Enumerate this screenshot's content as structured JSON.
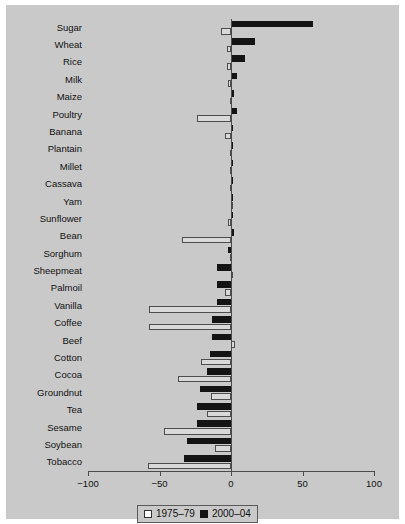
{
  "chart_data": {
    "type": "bar",
    "orientation": "horizontal",
    "title": "",
    "xlabel": "",
    "ylabel": "",
    "xlim": [
      -100,
      100
    ],
    "xticks": [
      -100,
      -50,
      0,
      50,
      100
    ],
    "xticklabels": [
      "−100",
      "−50",
      "0",
      "50",
      "100"
    ],
    "grid": false,
    "legend_position": "bottom-center",
    "categories": [
      "Sugar",
      "Wheat",
      "Rice",
      "Milk",
      "Maize",
      "Poultry",
      "Banana",
      "Plantain",
      "Millet",
      "Cassava",
      "Yam",
      "Sunflower",
      "Bean",
      "Sorghum",
      "Sheepmeat",
      "Palmoil",
      "Vanilla",
      "Coffee",
      "Beef",
      "Cotton",
      "Cocoa",
      "Groundnut",
      "Tea",
      "Sesame",
      "Soybean",
      "Tobacco"
    ],
    "series": [
      {
        "name": "1975–79",
        "color": "#d9d9d9",
        "values": [
          -7,
          -3,
          -3,
          -2,
          -1,
          -24,
          -4,
          -1,
          -1,
          -1,
          0,
          -2,
          -34,
          -1,
          1,
          -4,
          -57,
          -57,
          3,
          -21,
          -37,
          -14,
          -17,
          -47,
          -11,
          -58
        ]
      },
      {
        "name": "2000–04",
        "color": "#141414",
        "values": [
          57,
          17,
          10,
          4,
          2,
          4,
          1,
          0,
          0,
          0,
          0,
          1,
          2,
          -2,
          -10,
          -10,
          -10,
          -13,
          -13,
          -15,
          -17,
          -22,
          -24,
          -24,
          -31,
          -33
        ]
      }
    ]
  },
  "legend": {
    "items": [
      {
        "label": "1975–79",
        "swatch": "white-square-icon"
      },
      {
        "label": "2000–04",
        "swatch": "black-square-icon"
      }
    ]
  },
  "colors": {
    "panel_background": "#c9c9c9",
    "page_background": "#ffffff",
    "axis": "#4a4a4a",
    "series_old_fill": "#d9d9d9",
    "series_old_edge": "#4d4d4d",
    "series_new_fill": "#141414",
    "text": "#111111"
  }
}
